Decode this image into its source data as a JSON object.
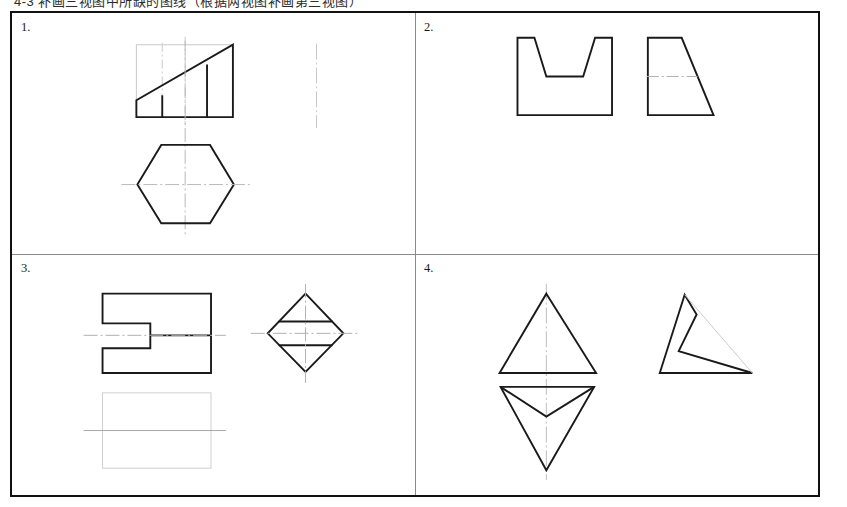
{
  "header": {
    "text": "4-3  补画三视图中所缺的图线（根据两视图补画第三视图）"
  },
  "sheet": {
    "border_color": "#111111",
    "divider_color": "#8a8a8a",
    "solid_line_color": "#1a1a1a",
    "construction_line_color": "#c9c9c9",
    "center_line_color": "#b0b0b0"
  },
  "panels": [
    {
      "id": "panel-1",
      "number": "1.",
      "views": [
        {
          "name": "front-view-wedge",
          "description": "Rectangle with rising diagonal top edge and two interior vertical division lines"
        },
        {
          "name": "top-view-hexagon",
          "description": "Regular hexagon with flat top and bottom, pointed left and right vertices"
        },
        {
          "name": "side-view-placeholder",
          "description": "Empty dash-dot vertical centerline marking the missing side view"
        }
      ]
    },
    {
      "id": "panel-2",
      "number": "2.",
      "views": [
        {
          "name": "front-view-u-block",
          "description": "Rectangular block with a tapered U notch cut from the top face"
        },
        {
          "name": "side-view-trapezoid",
          "description": "Right trapezoid with vertical left edge and slanted right edge, horizontal dash-dot centerline"
        }
      ]
    },
    {
      "id": "panel-3",
      "number": "3.",
      "views": [
        {
          "name": "front-view-notched-rectangle",
          "description": "Rectangle with a rectangular slot cut into the left edge and an interior horizontal line"
        },
        {
          "name": "side-view-diamond",
          "description": "Diamond with two horizontal chord lines and crossing centerlines"
        },
        {
          "name": "top-view-placeholder",
          "description": "Empty light construction rectangle with horizontal centerline for the missing top view"
        }
      ]
    },
    {
      "id": "panel-4",
      "number": "4.",
      "views": [
        {
          "name": "front-view-triangle",
          "description": "Upward pointing triangle with vertical dash-dot centerline"
        },
        {
          "name": "top-view-dart",
          "description": "Downward pointing triangle with interior V lines meeting below the centre"
        },
        {
          "name": "side-view-notched-triangle",
          "description": "Triangle with a V notch cut into its left side and a faint diagonal construction line"
        }
      ]
    }
  ]
}
